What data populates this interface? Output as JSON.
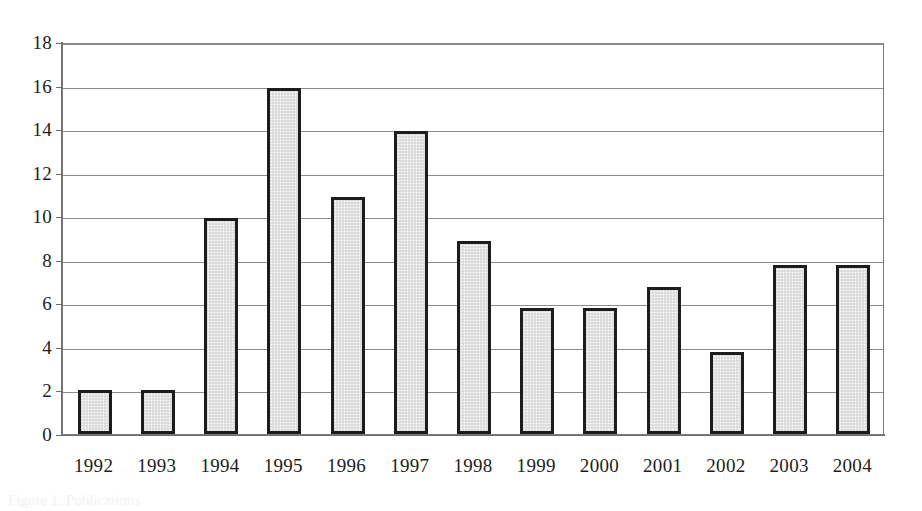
{
  "chart_data": {
    "type": "bar",
    "title": "",
    "subtitle": "",
    "xlabel": "",
    "ylabel": "",
    "categories": [
      "1992",
      "1993",
      "1994",
      "1995",
      "1996",
      "1997",
      "1998",
      "1999",
      "2000",
      "2001",
      "2002",
      "2003",
      "2004"
    ],
    "values": [
      2.0,
      2.0,
      9.9,
      15.9,
      10.9,
      13.9,
      8.85,
      5.8,
      5.8,
      6.75,
      3.75,
      7.75,
      7.75
    ],
    "series": [
      {
        "name": "",
        "values": [
          2.0,
          2.0,
          9.9,
          15.9,
          10.9,
          13.9,
          8.85,
          5.8,
          5.8,
          6.75,
          3.75,
          7.75,
          7.75
        ]
      }
    ],
    "ylim": [
      0,
      18
    ],
    "yticks": [
      0,
      2,
      4,
      6,
      8,
      10,
      12,
      14,
      16,
      18
    ],
    "ytick_labels": [
      "0",
      "2",
      "4",
      "6",
      "8",
      "10",
      "12",
      "14",
      "16",
      "18"
    ],
    "xtick_labels": [
      "1992",
      "1993",
      "1994",
      "1995",
      "1996",
      "1997",
      "1998",
      "1999",
      "2000",
      "2001",
      "2002",
      "2003",
      "2004"
    ],
    "grid": true,
    "grid_axis": "y",
    "legend": false,
    "legend_position": "none",
    "annotations": [],
    "colors": {
      "bar_fill": "#e2e2e2",
      "bar_border": "#1c1c1c",
      "gridline": "#8c8c8c",
      "axis": "#6e6e6e",
      "text": "#1d1d1d",
      "background": "#ffffff"
    }
  },
  "caption": {
    "fragment": "Figure 1. Publications"
  }
}
